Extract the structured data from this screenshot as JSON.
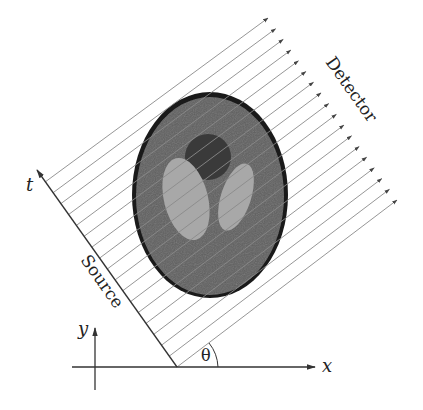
{
  "diagram": {
    "labels": {
      "detector": "Detector",
      "source": "Source",
      "t_axis": "t",
      "x_axis": "x",
      "y_axis": "y",
      "angle": "θ"
    },
    "colors": {
      "background": "#ffffff",
      "ray": "#8a8a8a",
      "axis": "#333333",
      "phantom_outline": "#1a1a1a",
      "phantom_body": "#5e5e5e",
      "phantom_dark_feature": "#3a3a3a",
      "phantom_light_feature": "#a8a8a8",
      "text": "#222222"
    },
    "geometry": {
      "origin": [
        177,
        367
      ],
      "source_tip": [
        37,
        170
      ],
      "ray_count": 18,
      "ray_angle_deg": 35.4,
      "phantom_center": [
        210,
        195
      ],
      "phantom_radii": [
        78,
        103
      ]
    }
  }
}
